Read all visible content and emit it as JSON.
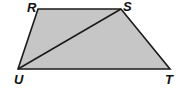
{
  "figure": {
    "type": "trapezoid-with-diagonal",
    "fill_color": "#c6c6c6",
    "stroke_color": "#1a1a1a",
    "vertices": [
      {
        "label": "R",
        "x": 38,
        "y": 9,
        "label_x": 27,
        "label_y": 12
      },
      {
        "label": "S",
        "x": 121,
        "y": 9,
        "label_x": 123,
        "label_y": 11
      },
      {
        "label": "T",
        "x": 170,
        "y": 69,
        "label_x": 165,
        "label_y": 84
      },
      {
        "label": "U",
        "x": 18,
        "y": 69,
        "label_x": 14,
        "label_y": 84
      }
    ],
    "diagonal": {
      "from": "U",
      "to": "S"
    }
  }
}
